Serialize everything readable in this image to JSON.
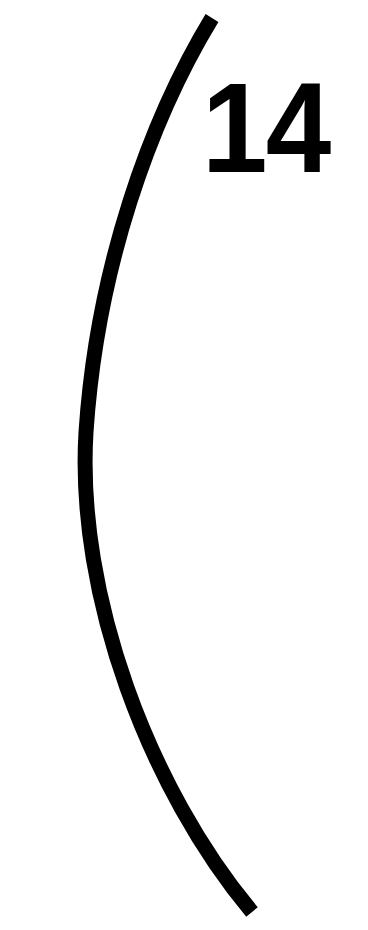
{
  "page": {
    "width": 368,
    "height": 930,
    "background_color": "#ffffff",
    "ink_color": "#000000",
    "title": "14"
  },
  "page_number": {
    "label": "14",
    "value": 14,
    "color": "#000000"
  },
  "artwork": {
    "name": "curved-bracket-stroke",
    "description": "Thick black arc bowing to the left",
    "color": "#000000",
    "stroke_width": 15,
    "start_point": [
      212,
      18
    ],
    "apex_point": [
      86,
      430
    ],
    "end_point": [
      252,
      912
    ]
  }
}
